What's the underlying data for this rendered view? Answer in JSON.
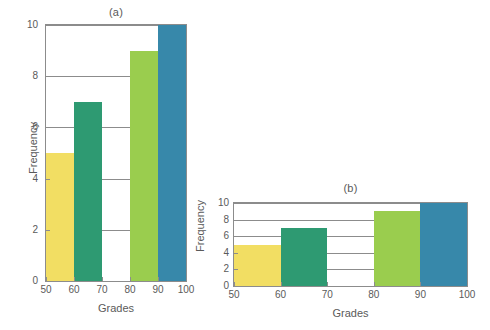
{
  "figure": {
    "background_color": "#ffffff",
    "axis_color": "#8c8c8c",
    "text_color": "#5a5a5a"
  },
  "chart_data": [
    {
      "type": "bar",
      "panel": "a",
      "title": "(a)",
      "xlabel": "Grades",
      "ylabel": "Frequency",
      "categories": [
        "50-60",
        "60-70",
        "70-80",
        "80-90",
        "90-100"
      ],
      "bin_edges": [
        50,
        60,
        70,
        80,
        90,
        100
      ],
      "values": [
        5,
        7,
        0,
        9,
        10
      ],
      "bar_colors": [
        "#f2de63",
        "#2e9a72",
        "#ffffff",
        "#9acd4e",
        "#3788aa"
      ],
      "xlim": [
        50,
        100
      ],
      "ylim": [
        0,
        10
      ],
      "xticks": [
        "50",
        "60",
        "70",
        "80",
        "90",
        "100"
      ],
      "yticks": [
        "0",
        "2",
        "4",
        "6",
        "8",
        "10"
      ],
      "grid": true,
      "legend": "none"
    },
    {
      "type": "bar",
      "panel": "b",
      "title": "(b)",
      "xlabel": "Grades",
      "ylabel": "Frequency",
      "categories": [
        "50-60",
        "60-70",
        "70-80",
        "80-90",
        "90-100"
      ],
      "bin_edges": [
        50,
        60,
        70,
        80,
        90,
        100
      ],
      "values": [
        5,
        7,
        0,
        9,
        10
      ],
      "bar_colors": [
        "#f2de63",
        "#2e9a72",
        "#ffffff",
        "#9acd4e",
        "#3788aa"
      ],
      "xlim": [
        50,
        100
      ],
      "ylim": [
        0,
        10
      ],
      "xticks": [
        "50",
        "60",
        "70",
        "80",
        "90",
        "100"
      ],
      "yticks": [
        "0",
        "2",
        "4",
        "6",
        "8",
        "10"
      ],
      "grid": true,
      "legend": "none"
    }
  ]
}
